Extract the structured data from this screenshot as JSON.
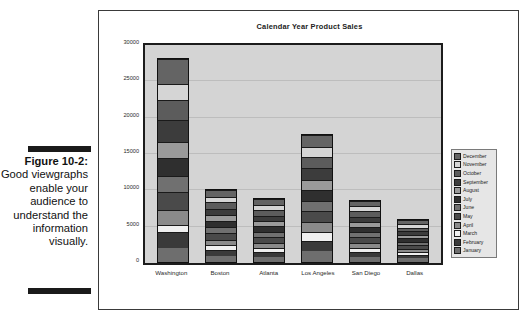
{
  "caption": {
    "figure_number": "Figure 10-2:",
    "text": "Good viewgraphs enable your audience to understand the information visually."
  },
  "figure": {
    "title": "Calendar Year Product Sales"
  },
  "chart_data": {
    "type": "bar",
    "stacked": true,
    "title": "Calendar Year Product Sales",
    "xlabel": "",
    "ylabel": "",
    "ylim": [
      0,
      30000
    ],
    "yticks": [
      0,
      5000,
      10000,
      15000,
      20000,
      25000,
      30000
    ],
    "ytick_labels": [
      "0",
      "5000",
      "10000",
      "15000",
      "20000",
      "25000",
      "30000"
    ],
    "grid": true,
    "legend_position": "right",
    "legend_order": [
      "December",
      "November",
      "October",
      "September",
      "August",
      "July",
      "June",
      "May",
      "April",
      "March",
      "February",
      "January"
    ],
    "categories": [
      "Washington",
      "Boston",
      "Atlanta",
      "Los Angeles",
      "San Diego",
      "Dallas"
    ],
    "series": [
      {
        "name": "January",
        "color": "#6e6e6e",
        "values": [
          1900,
          850,
          700,
          1500,
          700,
          500
        ]
      },
      {
        "name": "February",
        "color": "#3a3a3a",
        "values": [
          2300,
          800,
          650,
          1450,
          650,
          450
        ]
      },
      {
        "name": "March",
        "color": "#efefef",
        "values": [
          900,
          700,
          600,
          1250,
          600,
          400
        ]
      },
      {
        "name": "April",
        "color": "#8a8a8a",
        "values": [
          2000,
          750,
          700,
          1300,
          700,
          430
        ]
      },
      {
        "name": "May",
        "color": "#4a4a4a",
        "values": [
          2600,
          900,
          800,
          1550,
          750,
          520
        ]
      },
      {
        "name": "June",
        "color": "#707070",
        "values": [
          2100,
          800,
          700,
          1400,
          700,
          470
        ]
      },
      {
        "name": "July",
        "color": "#2f2f2f",
        "values": [
          2500,
          850,
          750,
          1500,
          720,
          500
        ]
      },
      {
        "name": "August",
        "color": "#9a9a9a",
        "values": [
          2200,
          800,
          700,
          1350,
          680,
          450
        ]
      },
      {
        "name": "September",
        "color": "#3c3c3c",
        "values": [
          3100,
          900,
          800,
          1600,
          760,
          530
        ]
      },
      {
        "name": "October",
        "color": "#5c5c5c",
        "values": [
          2700,
          850,
          750,
          1500,
          720,
          490
        ]
      },
      {
        "name": "November",
        "color": "#d5d5d5",
        "values": [
          2200,
          800,
          700,
          1400,
          700,
          460
        ]
      },
      {
        "name": "December",
        "color": "#646464",
        "values": [
          3500,
          900,
          800,
          1700,
          790,
          550
        ]
      }
    ],
    "totals": [
      28000,
      10000,
      8650,
      17500,
      8470,
      5750
    ]
  }
}
